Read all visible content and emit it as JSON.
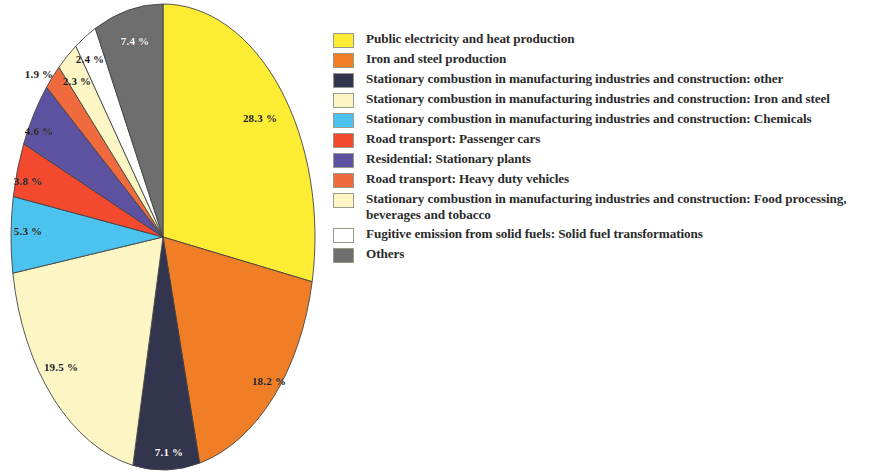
{
  "chart_data": {
    "type": "pie",
    "title": "",
    "subtitle": "",
    "xlabel": "",
    "ylabel": "",
    "legend_position": "right",
    "grid": false,
    "value_unit": "%",
    "start_angle_deg": 0,
    "direction": "clockwise",
    "categories": [
      "Public electricity  and heat production",
      "Iron and steel production",
      "Stationary combustion in manufacturing industries and construction: other",
      "Stationary combustion in manufacturing industries and construction: Iron and steel",
      "Stationary combustion in manufacturing industries and construction: Chemicals",
      "Road transport: Passenger cars",
      "Residential:  Stationary plants",
      "Road transport: Heavy duty vehicles",
      "Stationary combustion in manufacturing industries and construction: Food processing, beverages and tobacco",
      "Fugitive emission from solid fuels:  Solid fuel transformations",
      "Others"
    ],
    "values": [
      28.3,
      18.2,
      7.1,
      19.5,
      5.3,
      3.8,
      4.6,
      1.9,
      2.3,
      2.4,
      7.4
    ],
    "colors": [
      "#fdec34",
      "#f07e27",
      "#33344e",
      "#fbf6c4",
      "#4cc3ee",
      "#f2492f",
      "#5d52a0",
      "#ef6a3c",
      "#fbf6c4",
      "#ffffff",
      "#6e6e6e"
    ],
    "slice_order_clockwise": [
      {
        "label": "28.3 %",
        "value": 28.3,
        "color_index": 0
      },
      {
        "label": "18.2 %",
        "value": 18.2,
        "color_index": 1
      },
      {
        "label": "7.1 %",
        "value": 7.1,
        "color_index": 2
      },
      {
        "label": "19.5 %",
        "value": 19.5,
        "color_index": 3
      },
      {
        "label": "5.3 %",
        "value": 5.3,
        "color_index": 4
      },
      {
        "label": "3.8 %",
        "value": 3.8,
        "color_index": 5
      },
      {
        "label": "4.6 %",
        "value": 4.6,
        "color_index": 6
      },
      {
        "label": "1.9 %",
        "value": 1.9,
        "color_index": 7
      },
      {
        "label": "2.3 %",
        "value": 2.3,
        "color_index": 8
      },
      {
        "label": "2.4 %",
        "value": 2.4,
        "color_index": 9
      },
      {
        "label": "7.4 %",
        "value": 7.4,
        "color_index": 10
      }
    ]
  },
  "pie": {
    "labels": [
      {
        "text": "28.3 %",
        "x": 260,
        "y": 118,
        "style": "dark"
      },
      {
        "text": "18.2 %",
        "x": 269,
        "y": 381,
        "style": "dark"
      },
      {
        "text": "7.1 %",
        "x": 169,
        "y": 452,
        "style": "light"
      },
      {
        "text": "19.5 %",
        "x": 61,
        "y": 367,
        "style": "dark"
      },
      {
        "text": "5.3 %",
        "x": 28,
        "y": 231,
        "style": "dark"
      },
      {
        "text": "3.8 %",
        "x": 28,
        "y": 181,
        "style": "dark"
      },
      {
        "text": "4.6 %",
        "x": 39,
        "y": 131,
        "style": "dark"
      },
      {
        "text": "1.9 %",
        "x": 39,
        "y": 74,
        "style": "dark"
      },
      {
        "text": "2.3 %",
        "x": 77,
        "y": 81,
        "style": "dark"
      },
      {
        "text": "2.4 %",
        "x": 90,
        "y": 59,
        "style": "dark"
      },
      {
        "text": "7.4 %",
        "x": 135,
        "y": 41,
        "style": "light"
      }
    ]
  },
  "legend": {
    "items": [
      {
        "label": "Public electricity  and heat production",
        "color": "#fdec34"
      },
      {
        "label": "Iron and steel production",
        "color": "#f07e27"
      },
      {
        "label": "Stationary combustion in manufacturing industries and construction: other",
        "color": "#33344e"
      },
      {
        "label": "Stationary combustion in manufacturing industries and construction: Iron and steel",
        "color": "#fbf6c4"
      },
      {
        "label": "Stationary combustion in manufacturing industries and construction: Chemicals",
        "color": "#4cc3ee"
      },
      {
        "label": "Road transport: Passenger cars",
        "color": "#f2492f"
      },
      {
        "label": "Residential:  Stationary plants",
        "color": "#5d52a0"
      },
      {
        "label": "Road transport: Heavy duty vehicles",
        "color": "#ef6a3c"
      },
      {
        "label": "Stationary combustion in manufacturing industries and construction: Food processing, beverages and tobacco",
        "color": "#fbf6c4"
      },
      {
        "label": "Fugitive emission from solid fuels:  Solid fuel transformations",
        "color": "#ffffff"
      },
      {
        "label": "Others",
        "color": "#6e6e6e"
      }
    ]
  }
}
